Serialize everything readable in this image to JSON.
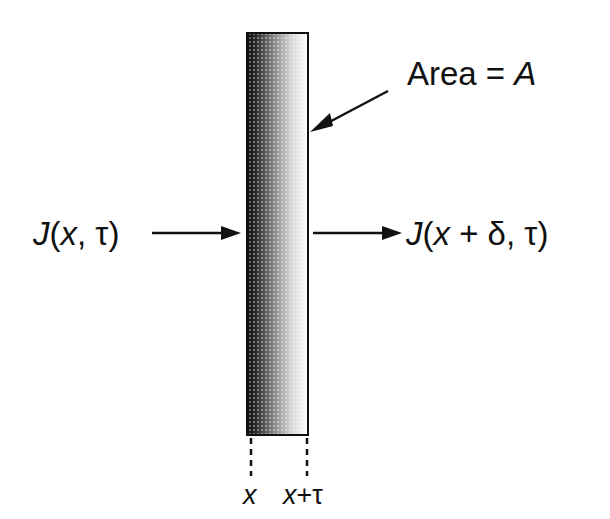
{
  "diagram": {
    "slab": {
      "x_left": 247,
      "x_right": 308,
      "y_top": 33,
      "y_bottom": 435,
      "fill": "gradient dark (left) to white (right), halftone dots",
      "dark_color": "#111111",
      "light_color": "#ffffff"
    },
    "area_label": {
      "prefix": "Area = ",
      "symbol": "A"
    },
    "incoming_flux": {
      "func": "J",
      "open": "(",
      "arg1": "x",
      "sep": ", ",
      "arg2": "τ",
      "close": ")"
    },
    "outgoing_flux": {
      "func": "J",
      "open": "(",
      "arg1": "x",
      "plus": " + ",
      "delta": "δ",
      "sep": ", ",
      "arg2": "τ",
      "close": ")"
    },
    "bottom_labels": {
      "left": "x",
      "right_var": "x",
      "right_plus": "+",
      "right_tau": "τ"
    }
  }
}
